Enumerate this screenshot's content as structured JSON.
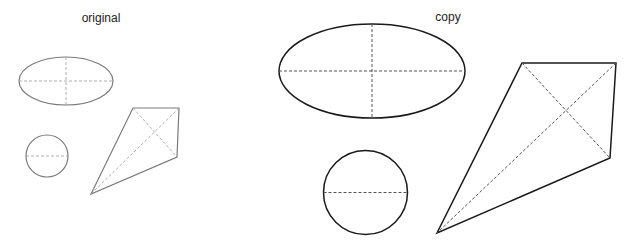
{
  "labels": {
    "original": "original",
    "copy": "copy"
  },
  "colors": {
    "original_stroke": "#7a7a7a",
    "copy_stroke": "#1a1a1a",
    "dash_original": "#9a9a9a",
    "dash_copy": "#555555",
    "background": "#ffffff"
  },
  "original": {
    "ellipse": {
      "cx": 66,
      "cy": 81,
      "rx": 47,
      "ry": 24
    },
    "circle": {
      "cx": 47,
      "cy": 156,
      "r": 21
    },
    "kite": {
      "points": [
        [
          133,
          108
        ],
        [
          179,
          108
        ],
        [
          177,
          157
        ],
        [
          91,
          194
        ]
      ]
    }
  },
  "copy": {
    "ellipse": {
      "cx": 372,
      "cy": 71,
      "rx": 93,
      "ry": 47
    },
    "circle": {
      "cx": 365.5,
      "cy": 192.5,
      "r": 42
    },
    "kite": {
      "points": [
        [
          522,
          63
        ],
        [
          616,
          63
        ],
        [
          610,
          158
        ],
        [
          437,
          233
        ]
      ]
    }
  }
}
